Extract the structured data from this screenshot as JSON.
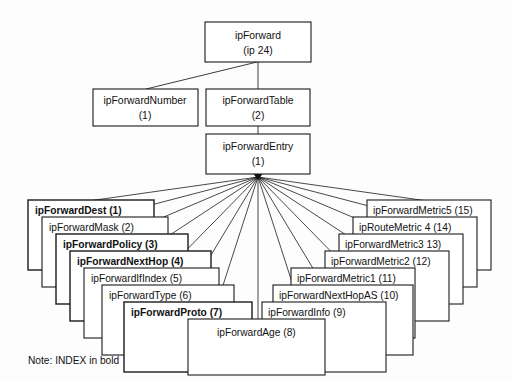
{
  "diagram": {
    "title_node": {
      "line1": "ipForward",
      "line2": "(ip 24)"
    },
    "second_row": [
      {
        "line1": "ipForwardNumber",
        "line2": "(1)"
      },
      {
        "line1": "ipForwardTable",
        "line2": "(2)"
      }
    ],
    "entry_node": {
      "line1": "ipForwardEntry",
      "line2": "(1)"
    },
    "note": "Note: INDEX in bold",
    "columns_left": [
      {
        "label": "ipForwardDest (1)",
        "bold": true
      },
      {
        "label": "ipForwardMask (2)",
        "bold": false
      },
      {
        "label": "ipForwardPolicy (3)",
        "bold": true
      },
      {
        "label": "ipForwardNextHop (4)",
        "bold": true
      },
      {
        "label": "ipForwardIfIndex (5)",
        "bold": false
      },
      {
        "label": "ipForwardType (6)",
        "bold": false
      },
      {
        "label": "ipForwardProto (7)",
        "bold": true
      }
    ],
    "columns_center": [
      {
        "label": "ipForwardAge (8)",
        "bold": false
      }
    ],
    "columns_right": [
      {
        "label": "ipForwardMetric5 (15)",
        "bold": false
      },
      {
        "label": "ipRouteMetric 4 (14)",
        "bold": false
      },
      {
        "label": "ipForwardMetric3 13)",
        "bold": false
      },
      {
        "label": "ipForwardMetric2 (12)",
        "bold": false
      },
      {
        "label": "ipForwardMetric1 (11)",
        "bold": false
      },
      {
        "label": "ipForwardNextHopAS (10)",
        "bold": false
      },
      {
        "label": "ipForwardInfo (9)",
        "bold": false
      }
    ],
    "colors": {
      "stroke": "#1a1a1a",
      "fill": "#ffffff",
      "text": "#111111",
      "background": "#fdfdfd"
    }
  }
}
